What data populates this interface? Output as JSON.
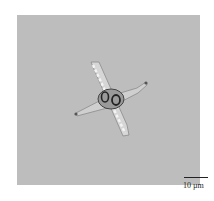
{
  "image": {
    "description": "Micrograph of a four-armed diatom-like cell on gray background",
    "background_color": "#bdbdbd"
  },
  "scale_bar": {
    "label": "10 µm"
  }
}
